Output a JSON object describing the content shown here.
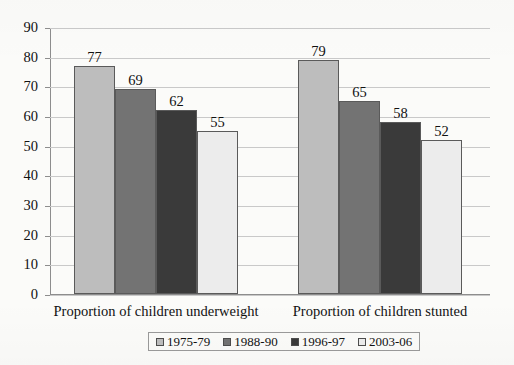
{
  "chart_data": {
    "type": "bar",
    "title": "",
    "subtitle": "",
    "xlabel": "",
    "ylabel": "",
    "categories": [
      "Proportion of children underweight",
      "Proportion of children stunted"
    ],
    "series": [
      {
        "name": "1975-79",
        "color": "#bdbdbd",
        "values": [
          77,
          79
        ]
      },
      {
        "name": "1988-90",
        "color": "#737373",
        "values": [
          69,
          65
        ]
      },
      {
        "name": "1996-97",
        "color": "#3a3a3a",
        "values": [
          62,
          58
        ]
      },
      {
        "name": "2003-06",
        "color": "#ececec",
        "values": [
          55,
          52
        ]
      }
    ],
    "ylim": [
      0,
      90
    ],
    "ytick_step": 10,
    "ytick_labels": [
      "0",
      "10",
      "20",
      "30",
      "40",
      "50",
      "60",
      "70",
      "80",
      "90"
    ],
    "grid": true,
    "legend_position": "bottom",
    "data_labels": true,
    "data_label_values": [
      [
        "77",
        "69",
        "62",
        "55"
      ],
      [
        "79",
        "65",
        "58",
        "52"
      ]
    ]
  },
  "legend": {
    "items": [
      {
        "label": "1975-79",
        "color": "#bdbdbd"
      },
      {
        "label": "1988-90",
        "color": "#737373"
      },
      {
        "label": "1996-97",
        "color": "#3a3a3a"
      },
      {
        "label": "2003-06",
        "color": "#ececec"
      }
    ]
  }
}
